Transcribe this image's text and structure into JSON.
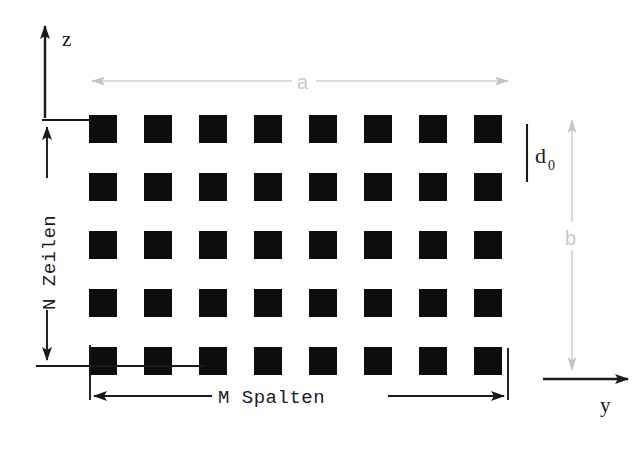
{
  "figure": {
    "background_color": "#fefefe",
    "ink_color": "#0d0d0d",
    "gray_color": "#cfcfd2"
  },
  "axes": {
    "vertical": {
      "label": "z",
      "direction": "up",
      "name": "z-axis"
    },
    "horizontal": {
      "label": "y",
      "direction": "right",
      "name": "y-axis"
    }
  },
  "dimensions": {
    "total_width": {
      "label": "a",
      "color": "#c9c9cc",
      "orientation": "horizontal",
      "arrowheads": "both"
    },
    "total_height": {
      "label": "b",
      "color": "#c9c9cc",
      "orientation": "vertical",
      "arrowheads": "both"
    },
    "gap": {
      "label": "d",
      "subscript": "0",
      "color": "#1b1b1f",
      "orientation": "vertical",
      "arrowheads": "none"
    },
    "rows": {
      "label": "N Zeilen",
      "orientation": "vertical",
      "arrowheads": "both"
    },
    "columns": {
      "label": "M Spalten",
      "orientation": "horizontal",
      "arrowheads": "both"
    }
  },
  "grid": {
    "columns": 8,
    "rows": 5,
    "cell_size": 28,
    "pitch_x": 55,
    "pitch_y": 58,
    "origin_x": 89,
    "origin_y": 115,
    "cell_color": "#0d0d0d"
  },
  "chart_data": {
    "type": "diagram",
    "columns": 8,
    "rows": 5,
    "cell_count": 40,
    "annotations": [
      "z",
      "y",
      "a",
      "b",
      "d0",
      "N Zeilen",
      "M Spalten"
    ]
  }
}
